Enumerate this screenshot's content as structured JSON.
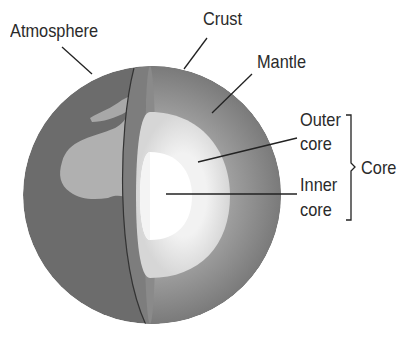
{
  "labels": {
    "atmosphere": "Atmosphere",
    "crust": "Crust",
    "mantle": "Mantle",
    "outer_core_1": "Outer",
    "outer_core_2": "core",
    "inner_core_1": "Inner",
    "inner_core_2": "core",
    "core": "Core"
  },
  "colors": {
    "mantle": "#8c8c8c",
    "outer_core": "#e6e6e6",
    "inner_core": "#ffffff",
    "surface": "#6e6e6e",
    "land": "#b4b4b4"
  }
}
